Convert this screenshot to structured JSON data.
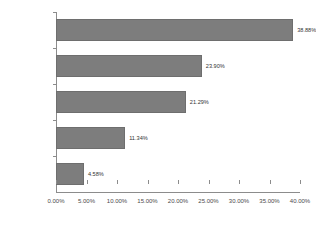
{
  "chart_data": {
    "type": "bar",
    "orientation": "horizontal",
    "title": "",
    "subtitle": "",
    "xlabel": "",
    "ylabel": "",
    "categories": [
      "1 to 10",
      "11 to 25",
      "26 to 100",
      "101 to 500",
      "501 plus"
    ],
    "values": [
      38.88,
      23.9,
      21.29,
      11.34,
      4.58
    ],
    "value_labels": [
      "38.88%",
      "23.90%",
      "21.29%",
      "11.34%",
      "4.58%"
    ],
    "xlim": [
      0,
      40
    ],
    "xticks": [
      0,
      5,
      10,
      15,
      20,
      25,
      30,
      35,
      40
    ],
    "xtick_labels": [
      "0.00%",
      "5.00%",
      "10.00%",
      "15.00%",
      "20.00%",
      "25.00%",
      "30.00%",
      "35.00%",
      "40.00%"
    ],
    "grid": false,
    "legend": false,
    "bar_color": "#7d7d7d",
    "axis_color": "#8c8c8c",
    "text_color": "#4a4a4a",
    "background": "#ffffff"
  }
}
